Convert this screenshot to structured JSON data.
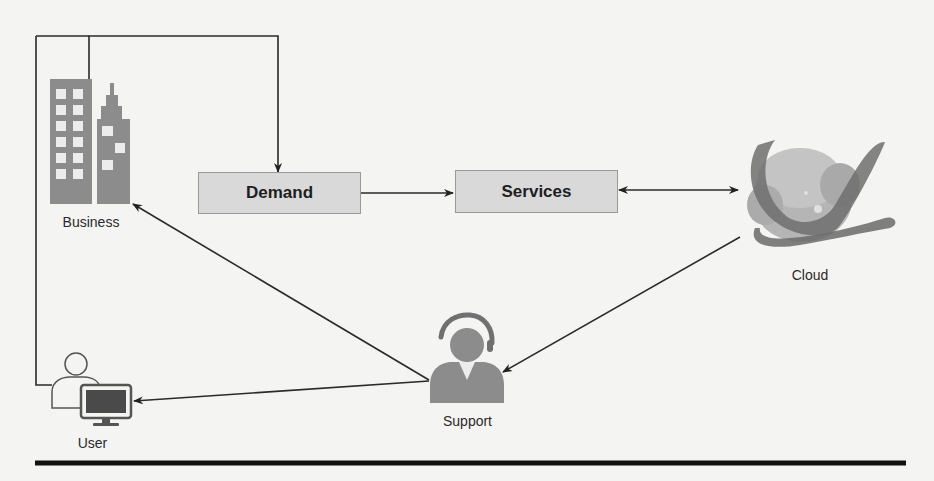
{
  "diagram": {
    "nodes": {
      "business": {
        "label": "Business",
        "icon": "buildings-icon"
      },
      "demand": {
        "label": "Demand"
      },
      "services": {
        "label": "Services"
      },
      "cloud": {
        "label": "Cloud",
        "icon": "cloud-globe-icon"
      },
      "support": {
        "label": "Support",
        "icon": "headset-agent-icon"
      },
      "user": {
        "label": "User",
        "icon": "user-computer-icon"
      }
    },
    "edges": [
      {
        "from": "business",
        "to": "demand",
        "type": "elbow-arrow"
      },
      {
        "from": "user",
        "to": "demand",
        "type": "elbow-arrow"
      },
      {
        "from": "demand",
        "to": "services",
        "type": "arrow"
      },
      {
        "from": "services",
        "to": "cloud",
        "type": "bidirectional-arrow"
      },
      {
        "from": "cloud",
        "to": "support",
        "type": "arrow"
      },
      {
        "from": "support",
        "to": "business",
        "type": "arrow"
      },
      {
        "from": "support",
        "to": "user",
        "type": "arrow"
      }
    ],
    "colors": {
      "background": "#f4f4f2",
      "box_fill": "#d9d9d9",
      "icon_gray": "#8c8c8c",
      "line": "#2a2a2a"
    }
  }
}
